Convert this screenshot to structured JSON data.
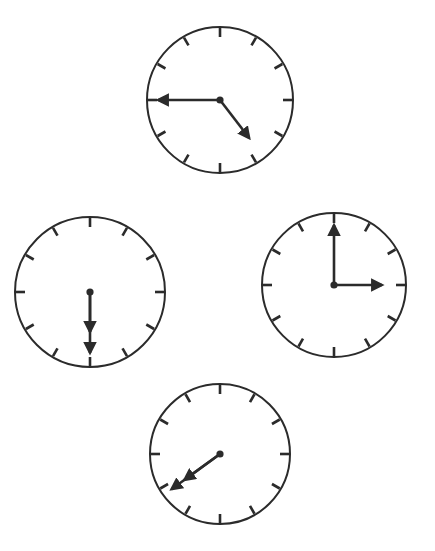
{
  "canvas": {
    "width": 435,
    "height": 551,
    "background": "#ffffff"
  },
  "style": {
    "stroke_color": "#2b2b2b",
    "dial_fill": "#ffffff",
    "dial_stroke_width": 2.0,
    "tick_stroke_width": 2.6,
    "hand_stroke_width": 2.6,
    "hub_radius": 3.6,
    "tick_count": 12,
    "tick_length": 9
  },
  "chart_data": {
    "type": "diagram",
    "item_count": 4,
    "clocks": [
      {
        "id": "clock-top",
        "position_label": "top",
        "center_x": 220,
        "center_y": 100,
        "radius": 73,
        "time": "4:45",
        "hour_value": 4,
        "minute_value": 45,
        "hands": [
          {
            "name": "minute-hand",
            "points_to": "9",
            "angle_deg": 270,
            "length": 62,
            "arrow": true
          },
          {
            "name": "hour-hand",
            "points_to": "between 4 and 5",
            "angle_deg": 142.5,
            "length": 48,
            "arrow": true
          }
        ]
      },
      {
        "id": "clock-left",
        "position_label": "left",
        "center_x": 90,
        "center_y": 292,
        "radius": 75,
        "time": "6:30",
        "hour_value": 6,
        "minute_value": 30,
        "hands": [
          {
            "name": "minute-hand",
            "points_to": "6",
            "angle_deg": 180,
            "length": 61,
            "arrow": true
          },
          {
            "name": "hour-hand",
            "points_to": "6",
            "angle_deg": 180,
            "length": 40,
            "arrow": true
          }
        ]
      },
      {
        "id": "clock-right",
        "position_label": "right",
        "center_x": 334,
        "center_y": 285,
        "radius": 72,
        "time": "3:00",
        "hour_value": 3,
        "minute_value": 0,
        "hands": [
          {
            "name": "minute-hand",
            "points_to": "12",
            "angle_deg": 0,
            "length": 60,
            "arrow": true
          },
          {
            "name": "hour-hand",
            "points_to": "3",
            "angle_deg": 90,
            "length": 48,
            "arrow": true
          }
        ]
      },
      {
        "id": "clock-bottom",
        "position_label": "bottom",
        "center_x": 220,
        "center_y": 454,
        "radius": 70,
        "time": "7:40",
        "hour_value": 7,
        "minute_value": 40,
        "hands": [
          {
            "name": "minute-hand",
            "points_to": "8",
            "angle_deg": 234,
            "length": 60,
            "arrow": true
          },
          {
            "name": "hour-hand",
            "points_to": "between 7 and 8",
            "angle_deg": 234,
            "length": 44,
            "arrow": true
          }
        ]
      }
    ]
  }
}
